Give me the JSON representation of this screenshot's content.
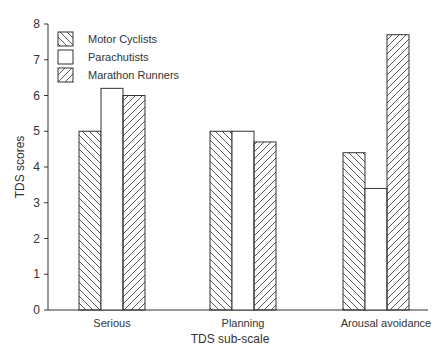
{
  "chart_data": {
    "type": "bar",
    "title": "",
    "xlabel": "TDS sub-scale",
    "ylabel": "TDS scores",
    "ylim": [
      0,
      8
    ],
    "yticks": [
      0,
      1,
      2,
      3,
      4,
      5,
      6,
      7,
      8
    ],
    "grid": false,
    "legend_position": "upper-left",
    "categories": [
      "Serious",
      "Planning",
      "Arousal avoidance"
    ],
    "series": [
      {
        "name": "Motor Cyclists",
        "pattern": "hatch-backslash",
        "values": [
          5.0,
          5.0,
          4.4
        ]
      },
      {
        "name": "Parachutists",
        "pattern": "none",
        "values": [
          6.2,
          5.0,
          3.4
        ]
      },
      {
        "name": "Marathon Runners",
        "pattern": "hatch-slash",
        "values": [
          6.0,
          4.7,
          7.7
        ]
      }
    ]
  },
  "colors": {
    "axis": "#333333",
    "bar_fill": "#ffffff",
    "bar_stroke": "#333333",
    "hatch": "#444444"
  }
}
